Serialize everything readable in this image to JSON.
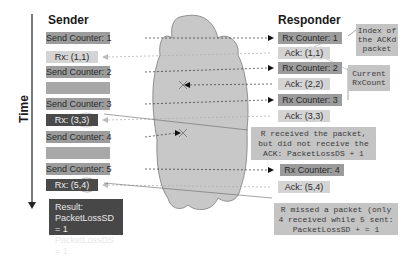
{
  "headers": {
    "sender": "Sender",
    "responder": "Responder",
    "time": "Time"
  },
  "sender": [
    {
      "label": "Send Counter: 1",
      "style": "dark1",
      "y": 32
    },
    {
      "label": "Rx: (1,1)",
      "style": "light",
      "y": 51
    },
    {
      "label": "Send Counter: 2",
      "style": "dark1",
      "y": 66
    },
    {
      "label": "",
      "style": "blank",
      "y": 82
    },
    {
      "label": "Send Counter: 3",
      "style": "dark1",
      "y": 98
    },
    {
      "label": "Rx: (3,3)",
      "style": "darkbox",
      "y": 114
    },
    {
      "label": "Send Counter: 4",
      "style": "dark1",
      "y": 131
    },
    {
      "label": "",
      "style": "blank",
      "y": 147
    },
    {
      "label": "Send Counter: 5",
      "style": "dark1",
      "y": 163
    },
    {
      "label": "Rx: (5,4)",
      "style": "darkbox",
      "y": 179
    }
  ],
  "responder": [
    {
      "label": "Rx Counter: 1",
      "style": "dark1",
      "y": 32
    },
    {
      "label": "Ack: (1,1)",
      "style": "light",
      "y": 47
    },
    {
      "label": "Rx Counter: 2",
      "style": "dark1",
      "y": 62
    },
    {
      "label": "Ack: (2,2)",
      "style": "light",
      "y": 78
    },
    {
      "label": "Rx Counter: 3",
      "style": "dark1",
      "y": 94
    },
    {
      "label": "Ack: (3,3)",
      "style": "light",
      "y": 110
    },
    {
      "label": "Rx Counter: 4",
      "style": "dark1",
      "y": 164
    },
    {
      "label": "Ack: (5,4)",
      "style": "light",
      "y": 181
    }
  ],
  "notes": {
    "index_acked": [
      "Index of",
      "the ACKd",
      "packet"
    ],
    "current_rxcount": [
      "Current",
      "RxCount"
    ],
    "lost_ack": [
      "R received the packet,",
      "but did not receive the",
      "ACK: PacketLossDS + 1"
    ],
    "missed_packet": [
      "R missed a packet (only",
      "4 received while 5 sent:",
      "PacketLossSD + = 1"
    ]
  },
  "result": {
    "title": "Result:",
    "line1": "PacketLossSD = 1",
    "line2": "PacketLossDS = 1"
  },
  "colors": {
    "cloud_fill": "#c8c8c8",
    "cloud_stroke": "#7a7a7a",
    "dark_box": "#4a4a4a",
    "mid_box": "#9c9c9c",
    "light_box": "#d4d4d4",
    "note_bg": "#c4c4c4"
  }
}
